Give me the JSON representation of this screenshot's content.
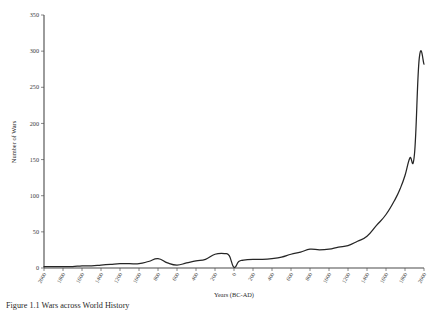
{
  "figure": {
    "caption": "Figure 1.1  Wars across World History",
    "caption_visible_note": "clipped at image bottom edge"
  },
  "chart_data": {
    "type": "line",
    "title": "",
    "xlabel": "Years (BC-AD)",
    "ylabel": "Number of Wars",
    "xlim": [
      -2000,
      2000
    ],
    "ylim": [
      0,
      350
    ],
    "grid": false,
    "legend": null,
    "ytick_labels": [
      "0",
      "50",
      "100",
      "150",
      "200",
      "250",
      "300",
      "350"
    ],
    "ytick_values": [
      0,
      50,
      100,
      150,
      200,
      250,
      300,
      350
    ],
    "xtick_labels": [
      "2000",
      "1800",
      "1600",
      "1400",
      "1200",
      "1000",
      "800",
      "600",
      "400",
      "200",
      "0",
      "200",
      "400",
      "600",
      "800",
      "1000",
      "1200",
      "1400",
      "1600",
      "1800",
      "2000"
    ],
    "xtick_values": [
      -2000,
      -1800,
      -1600,
      -1400,
      -1200,
      -1000,
      -800,
      -600,
      -400,
      -200,
      0,
      200,
      400,
      600,
      800,
      1000,
      1200,
      1400,
      1600,
      1800,
      2000
    ],
    "series": [
      {
        "name": "Number of Wars",
        "color": "#262626",
        "x": [
          -2000,
          -1900,
          -1800,
          -1700,
          -1600,
          -1500,
          -1400,
          -1300,
          -1200,
          -1100,
          -1000,
          -900,
          -800,
          -700,
          -600,
          -500,
          -400,
          -300,
          -200,
          -100,
          -50,
          0,
          50,
          100,
          200,
          300,
          400,
          500,
          600,
          700,
          800,
          900,
          1000,
          1100,
          1200,
          1300,
          1400,
          1500,
          1600,
          1700,
          1750,
          1800,
          1850,
          1900,
          1950,
          2000
        ],
        "values": [
          2,
          2,
          2,
          2,
          3,
          3,
          4,
          5,
          6,
          6,
          6,
          9,
          13,
          7,
          4,
          7,
          10,
          12,
          19,
          20,
          17,
          1,
          9,
          11,
          12,
          12,
          13,
          15,
          19,
          22,
          26,
          25,
          26,
          29,
          31,
          37,
          44,
          59,
          74,
          96,
          110,
          128,
          152,
          158,
          290,
          282
        ]
      }
    ]
  }
}
